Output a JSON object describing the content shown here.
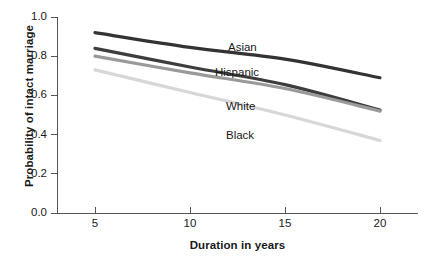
{
  "chart_data": {
    "type": "line",
    "title": "",
    "xlabel": "Duration in years",
    "ylabel": "Probability of intact marriage",
    "xlim": [
      3,
      22
    ],
    "ylim": [
      0.0,
      1.0
    ],
    "xticks": [
      5,
      10,
      15,
      20
    ],
    "xtick_labels": [
      "5",
      "10",
      "15",
      "20"
    ],
    "yticks": [
      0.0,
      0.2,
      0.4,
      0.6,
      0.8,
      1.0
    ],
    "ytick_labels": [
      "0.0",
      "0.2",
      "0.4",
      "0.6",
      "0.8",
      "1.0"
    ],
    "grid": false,
    "legend_position": "inline-labels",
    "x": [
      5,
      10,
      15,
      20
    ],
    "series": [
      {
        "name": "Asian",
        "color": "#333333",
        "values": [
          0.92,
          0.845,
          0.785,
          0.69
        ],
        "label_x": 228,
        "label_y": 42
      },
      {
        "name": "Hispanic",
        "color": "#3d3d3d",
        "values": [
          0.84,
          0.745,
          0.655,
          0.525
        ],
        "label_x": 215,
        "label_y": 67
      },
      {
        "name": "White",
        "color": "#9a9a9a",
        "values": [
          0.8,
          0.715,
          0.635,
          0.52
        ],
        "label_x": 226,
        "label_y": 101
      },
      {
        "name": "Black",
        "color": "#d7d7d7",
        "values": [
          0.73,
          0.615,
          0.5,
          0.37
        ],
        "label_x": 226,
        "label_y": 130
      }
    ]
  }
}
